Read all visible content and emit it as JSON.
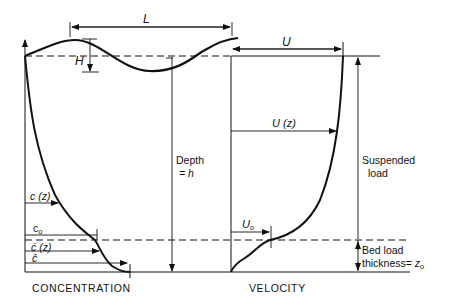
{
  "diagram": {
    "type": "sediment transport profile schematic",
    "left_panel": {
      "axis_label": "CONCENTRATION",
      "labels": {
        "wave_length": "L",
        "wave_height": "H",
        "conc_z": "c (z)",
        "conc_0": "c",
        "conc_0_sub": "o",
        "conc_z_bar": "c̄ (z)",
        "conc_eps": "ĉ"
      }
    },
    "middle": {
      "depth_label_line1": "Depth",
      "depth_label_line2": "= h"
    },
    "right_panel": {
      "axis_label": "VELOCITY",
      "labels": {
        "surface_velocity": "U",
        "velocity_z": "U (z)",
        "velocity_0": "U",
        "velocity_0_sub": "o",
        "suspended_line1": "Suspended",
        "suspended_line2": "load",
        "bed_line1": "Bed load",
        "bed_line2": "thickness= ",
        "bed_symbol": "z",
        "bed_symbol_sub": "o"
      }
    },
    "colors": {
      "ink": "#111111",
      "background": "#ffffff"
    }
  }
}
